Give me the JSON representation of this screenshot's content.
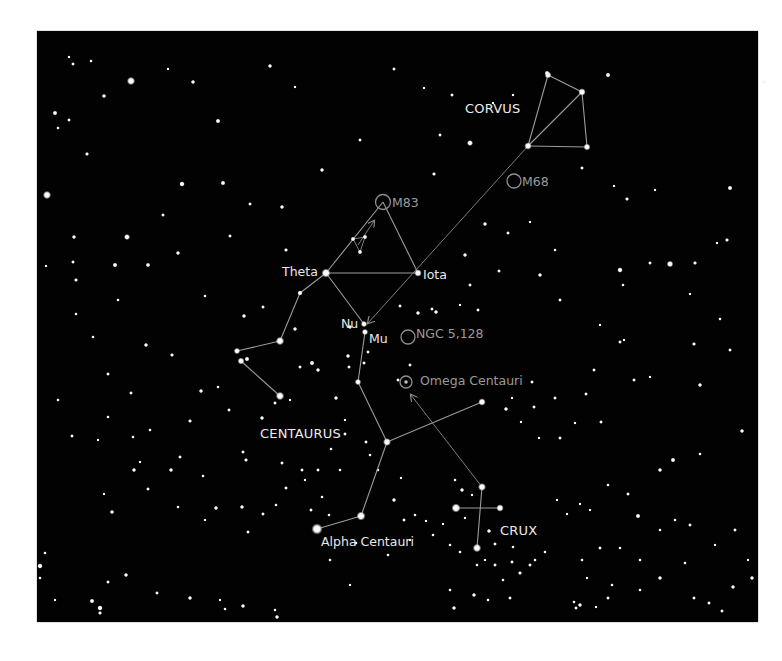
{
  "chart": {
    "background": "#020202",
    "line_color": "#9c9c9c",
    "label_color": "#e8e8e8",
    "dso_color": "#9a9a9a"
  },
  "constellations": [
    {
      "name": "CORVUS",
      "x": 465,
      "y": 113
    },
    {
      "name": "CENTAURUS",
      "x": 260,
      "y": 438
    },
    {
      "name": "CRUX",
      "x": 500,
      "y": 535
    }
  ],
  "stars_labeled": [
    {
      "name": "Theta",
      "x": 282,
      "y": 276
    },
    {
      "name": "Iota",
      "x": 423,
      "y": 279
    },
    {
      "name": "Nu",
      "x": 341,
      "y": 328
    },
    {
      "name": "Mu",
      "x": 369,
      "y": 343
    },
    {
      "name": "Alpha Centauri",
      "x": 321,
      "y": 546
    }
  ],
  "deep_sky_objects": [
    {
      "name": "M83",
      "x": 392,
      "y": 207
    },
    {
      "name": "M68",
      "x": 522,
      "y": 186
    },
    {
      "name": "NGC 5,128",
      "x": 416,
      "y": 338
    },
    {
      "name": "Omega Centauri",
      "x": 420,
      "y": 385
    }
  ],
  "lines": {
    "corvus": [
      [
        548,
        75,
        582,
        92
      ],
      [
        582,
        92,
        587,
        147
      ],
      [
        587,
        147,
        528,
        146
      ],
      [
        528,
        146,
        548,
        75
      ],
      [
        582,
        92,
        528,
        146
      ]
    ],
    "centaurus": [
      [
        326,
        273,
        418,
        273
      ],
      [
        418,
        273,
        383,
        202
      ],
      [
        383,
        202,
        326,
        273
      ],
      [
        326,
        273,
        300,
        293
      ],
      [
        300,
        293,
        280,
        341
      ],
      [
        280,
        341,
        237,
        351
      ],
      [
        241,
        361,
        280,
        396
      ],
      [
        326,
        273,
        364,
        324
      ],
      [
        365,
        332,
        358,
        382
      ],
      [
        358,
        382,
        387,
        442
      ],
      [
        387,
        442,
        482,
        402
      ],
      [
        387,
        442,
        361,
        516
      ],
      [
        361,
        516,
        317,
        529
      ]
    ],
    "crux": [
      [
        482,
        487,
        477,
        548
      ],
      [
        456,
        508,
        500,
        508
      ]
    ],
    "asterism": [
      [
        353,
        239,
        365,
        237
      ],
      [
        353,
        239,
        360,
        252
      ],
      [
        365,
        237,
        360,
        252
      ]
    ]
  },
  "pointers": [
    {
      "from": [
        528,
        146
      ],
      "to": [
        368,
        323
      ]
    },
    {
      "from": [
        482,
        487
      ],
      "to": [
        411,
        395
      ]
    },
    {
      "from": [
        358,
        245
      ],
      "to": [
        374,
        221
      ]
    }
  ],
  "key_stars": [
    [
      548,
      75,
      2.6
    ],
    [
      582,
      92,
      2.8
    ],
    [
      528,
      146,
      2.8
    ],
    [
      587,
      147,
      2.6
    ],
    [
      326,
      273,
      3.4
    ],
    [
      418,
      273,
      2.8
    ],
    [
      364,
      324,
      2.4
    ],
    [
      365,
      332,
      2.4
    ],
    [
      300,
      293,
      2.0
    ],
    [
      280,
      341,
      3.2
    ],
    [
      237,
      351,
      2.4
    ],
    [
      241,
      361,
      2.6
    ],
    [
      280,
      396,
      3.2
    ],
    [
      358,
      382,
      2.4
    ],
    [
      387,
      442,
      3.0
    ],
    [
      482,
      402,
      2.8
    ],
    [
      361,
      516,
      3.4
    ],
    [
      317,
      529,
      4.2
    ],
    [
      482,
      487,
      3.0
    ],
    [
      456,
      508,
      3.4
    ],
    [
      500,
      508,
      2.8
    ],
    [
      477,
      548,
      3.2
    ],
    [
      353,
      239,
      1.8
    ],
    [
      365,
      237,
      1.8
    ],
    [
      360,
      252,
      1.8
    ],
    [
      547,
      73,
      1.8
    ]
  ],
  "field_stars": [
    [
      69,
      57,
      1.2
    ],
    [
      73,
      64,
      1.4
    ],
    [
      91,
      61,
      1.3
    ],
    [
      168,
      69,
      1.2
    ],
    [
      270,
      66,
      1.6
    ],
    [
      394,
      69,
      1.4
    ],
    [
      608,
      75,
      1.8
    ],
    [
      764,
      82,
      1.3
    ],
    [
      193,
      82,
      1.6
    ],
    [
      295,
      87,
      1.2
    ],
    [
      424,
      88,
      1.2
    ],
    [
      452,
      95,
      1.4
    ],
    [
      493,
      103,
      1.2
    ],
    [
      513,
      95,
      1.2
    ],
    [
      440,
      135,
      1.4
    ],
    [
      470,
      143,
      2.2
    ],
    [
      131,
      81,
      3.0
    ],
    [
      47,
      195,
      3.0
    ],
    [
      74,
      237,
      1.6
    ],
    [
      55,
      113,
      1.8
    ],
    [
      69,
      120,
      1.4
    ],
    [
      87,
      154,
      1.5
    ],
    [
      104,
      96,
      1.6
    ],
    [
      58,
      128,
      1.3
    ],
    [
      182,
      184,
      2.0
    ],
    [
      218,
      121,
      1.8
    ],
    [
      223,
      183,
      1.8
    ],
    [
      250,
      204,
      1.4
    ],
    [
      282,
      207,
      1.6
    ],
    [
      286,
      250,
      1.5
    ],
    [
      322,
      170,
      1.6
    ],
    [
      360,
      140,
      1.4
    ],
    [
      127,
      237,
      2.2
    ],
    [
      115,
      265,
      1.8
    ],
    [
      73,
      262,
      1.4
    ],
    [
      76,
      314,
      1.3
    ],
    [
      46,
      266,
      1.2
    ],
    [
      76,
      280,
      1.5
    ],
    [
      148,
      265,
      1.7
    ],
    [
      163,
      215,
      1.4
    ],
    [
      178,
      253,
      1.6
    ],
    [
      118,
      300,
      1.3
    ],
    [
      93,
      337,
      1.3
    ],
    [
      108,
      374,
      1.4
    ],
    [
      146,
      345,
      1.6
    ],
    [
      172,
      355,
      1.5
    ],
    [
      205,
      296,
      1.3
    ],
    [
      230,
      236,
      1.4
    ],
    [
      201,
      391,
      1.6
    ],
    [
      244,
      316,
      1.6
    ],
    [
      247,
      359,
      1.8
    ],
    [
      263,
      307,
      1.4
    ],
    [
      295,
      329,
      1.6
    ],
    [
      312,
      363,
      1.8
    ],
    [
      318,
      370,
      1.6
    ],
    [
      300,
      367,
      1.4
    ],
    [
      350,
      327,
      1.6
    ],
    [
      348,
      356,
      1.6
    ],
    [
      349,
      367,
      1.4
    ],
    [
      364,
      363,
      1.4
    ],
    [
      368,
      352,
      1.4
    ],
    [
      398,
      380,
      1.4
    ],
    [
      410,
      365,
      1.4
    ],
    [
      400,
      306,
      1.4
    ],
    [
      418,
      313,
      1.6
    ],
    [
      436,
      312,
      1.6
    ],
    [
      432,
      309,
      1.4
    ],
    [
      460,
      305,
      1.2
    ],
    [
      478,
      310,
      1.4
    ],
    [
      470,
      285,
      1.4
    ],
    [
      465,
      255,
      1.6
    ],
    [
      434,
      174,
      1.5
    ],
    [
      485,
      224,
      1.6
    ],
    [
      508,
      233,
      1.4
    ],
    [
      530,
      222,
      1.2
    ],
    [
      499,
      271,
      1.4
    ],
    [
      540,
      275,
      1.6
    ],
    [
      555,
      250,
      1.3
    ],
    [
      560,
      300,
      1.4
    ],
    [
      582,
      168,
      1.4
    ],
    [
      627,
      199,
      1.5
    ],
    [
      614,
      186,
      1.2
    ],
    [
      655,
      190,
      1.2
    ],
    [
      730,
      188,
      1.8
    ],
    [
      727,
      240,
      1.5
    ],
    [
      717,
      243,
      1.2
    ],
    [
      650,
      263,
      1.4
    ],
    [
      695,
      263,
      1.5
    ],
    [
      670,
      264,
      2.4
    ],
    [
      620,
      270,
      2.0
    ],
    [
      623,
      285,
      1.3
    ],
    [
      690,
      294,
      1.2
    ],
    [
      720,
      319,
      1.3
    ],
    [
      600,
      325,
      1.2
    ],
    [
      620,
      342,
      1.4
    ],
    [
      624,
      340,
      1.2
    ],
    [
      694,
      344,
      1.5
    ],
    [
      730,
      350,
      1.4
    ],
    [
      594,
      370,
      1.4
    ],
    [
      634,
      380,
      1.4
    ],
    [
      650,
      377,
      1.2
    ],
    [
      700,
      385,
      1.6
    ],
    [
      742,
      431,
      1.6
    ],
    [
      601,
      422,
      1.4
    ],
    [
      575,
      423,
      1.2
    ],
    [
      586,
      394,
      1.4
    ],
    [
      673,
      460,
      1.8
    ],
    [
      660,
      470,
      1.6
    ],
    [
      700,
      454,
      1.3
    ],
    [
      608,
      485,
      1.3
    ],
    [
      628,
      494,
      1.4
    ],
    [
      638,
      516,
      1.8
    ],
    [
      675,
      520,
      1.3
    ],
    [
      690,
      525,
      1.4
    ],
    [
      660,
      530,
      1.3
    ],
    [
      560,
      438,
      1.4
    ],
    [
      555,
      398,
      1.4
    ],
    [
      532,
      382,
      1.4
    ],
    [
      534,
      407,
      1.4
    ],
    [
      521,
      422,
      1.2
    ],
    [
      539,
      438,
      1.2
    ],
    [
      512,
      398,
      1.2
    ],
    [
      506,
      409,
      1.6
    ],
    [
      557,
      500,
      1.2
    ],
    [
      580,
      504,
      1.2
    ],
    [
      582,
      560,
      1.3
    ],
    [
      587,
      578,
      1.2
    ],
    [
      590,
      510,
      1.2
    ],
    [
      567,
      514,
      1.2
    ],
    [
      600,
      548,
      1.4
    ],
    [
      620,
      548,
      1.3
    ],
    [
      640,
      560,
      1.3
    ],
    [
      685,
      563,
      1.3
    ],
    [
      715,
      545,
      1.2
    ],
    [
      733,
      587,
      1.6
    ],
    [
      752,
      578,
      1.6
    ],
    [
      735,
      530,
      1.4
    ],
    [
      748,
      560,
      1.2
    ],
    [
      722,
      611,
      1.4
    ],
    [
      709,
      603,
      1.4
    ],
    [
      694,
      598,
      1.4
    ],
    [
      660,
      578,
      1.6
    ],
    [
      640,
      590,
      1.3
    ],
    [
      612,
      585,
      1.3
    ],
    [
      608,
      598,
      1.4
    ],
    [
      596,
      607,
      1.2
    ],
    [
      580,
      605,
      1.6
    ],
    [
      576,
      608,
      1.4
    ],
    [
      574,
      602,
      1.3
    ],
    [
      510,
      598,
      1.4
    ],
    [
      488,
      600,
      1.3
    ],
    [
      474,
      595,
      1.6
    ],
    [
      454,
      608,
      1.6
    ],
    [
      450,
      590,
      1.3
    ],
    [
      520,
      573,
      1.5
    ],
    [
      530,
      565,
      1.4
    ],
    [
      545,
      552,
      1.3
    ],
    [
      535,
      560,
      1.3
    ],
    [
      512,
      562,
      1.4
    ],
    [
      503,
      580,
      1.3
    ],
    [
      495,
      565,
      1.4
    ],
    [
      477,
      565,
      1.3
    ],
    [
      485,
      560,
      1.2
    ],
    [
      460,
      552,
      1.3
    ],
    [
      450,
      545,
      1.3
    ],
    [
      495,
      544,
      1.4
    ],
    [
      513,
      547,
      1.3
    ],
    [
      462,
      490,
      1.6
    ],
    [
      455,
      480,
      1.3
    ],
    [
      472,
      495,
      1.2
    ],
    [
      465,
      518,
      1.2
    ],
    [
      489,
      531,
      1.6
    ],
    [
      443,
      524,
      1.2
    ],
    [
      426,
      521,
      1.2
    ],
    [
      415,
      515,
      1.3
    ],
    [
      433,
      535,
      1.3
    ],
    [
      404,
      520,
      1.4
    ],
    [
      410,
      540,
      1.2
    ],
    [
      388,
      555,
      1.3
    ],
    [
      356,
      543,
      1.3
    ],
    [
      330,
      560,
      1.3
    ],
    [
      350,
      585,
      1.2
    ],
    [
      277,
      617,
      1.6
    ],
    [
      275,
      610,
      1.3
    ],
    [
      243,
      606,
      1.6
    ],
    [
      225,
      609,
      1.3
    ],
    [
      220,
      600,
      1.2
    ],
    [
      190,
      598,
      1.6
    ],
    [
      157,
      593,
      1.4
    ],
    [
      126,
      575,
      1.6
    ],
    [
      100,
      608,
      2.0
    ],
    [
      92,
      601,
      1.8
    ],
    [
      100,
      613,
      1.5
    ],
    [
      40,
      566,
      2.0
    ],
    [
      55,
      600,
      1.2
    ],
    [
      40,
      578,
      1.3
    ],
    [
      148,
      489,
      1.4
    ],
    [
      112,
      512,
      1.6
    ],
    [
      104,
      494,
      1.2
    ],
    [
      108,
      582,
      1.4
    ],
    [
      134,
      470,
      1.6
    ],
    [
      171,
      470,
      1.6
    ],
    [
      180,
      457,
      1.4
    ],
    [
      203,
      476,
      1.3
    ],
    [
      205,
      520,
      1.2
    ],
    [
      216,
      508,
      1.6
    ],
    [
      242,
      507,
      1.6
    ],
    [
      248,
      532,
      1.4
    ],
    [
      263,
      514,
      1.4
    ],
    [
      276,
      505,
      1.3
    ],
    [
      286,
      488,
      1.4
    ],
    [
      302,
      470,
      1.4
    ],
    [
      305,
      480,
      1.2
    ],
    [
      311,
      510,
      1.4
    ],
    [
      246,
      460,
      1.5
    ],
    [
      243,
      452,
      1.4
    ],
    [
      262,
      418,
      1.6
    ],
    [
      275,
      403,
      1.4
    ],
    [
      290,
      400,
      1.2
    ],
    [
      336,
      398,
      1.6
    ],
    [
      345,
      434,
      1.4
    ],
    [
      366,
      442,
      1.4
    ],
    [
      370,
      455,
      1.3
    ],
    [
      394,
      500,
      1.6
    ],
    [
      340,
      470,
      1.3
    ],
    [
      318,
      470,
      1.4
    ],
    [
      282,
      463,
      1.4
    ],
    [
      322,
      497,
      1.3
    ],
    [
      329,
      515,
      1.3
    ],
    [
      345,
      420,
      1.2
    ],
    [
      331,
      449,
      1.3
    ],
    [
      378,
      470,
      1.3
    ],
    [
      401,
      478,
      1.2
    ],
    [
      178,
      507,
      1.3
    ],
    [
      58,
      400,
      1.3
    ],
    [
      72,
      436,
      1.4
    ],
    [
      98,
      440,
      1.2
    ],
    [
      108,
      417,
      1.3
    ],
    [
      131,
      393,
      1.4
    ],
    [
      133,
      437,
      1.3
    ],
    [
      190,
      421,
      1.5
    ],
    [
      150,
      430,
      1.3
    ],
    [
      218,
      387,
      1.3
    ],
    [
      229,
      410,
      1.4
    ],
    [
      140,
      462,
      1.2
    ],
    [
      45,
      553,
      1.3
    ]
  ]
}
